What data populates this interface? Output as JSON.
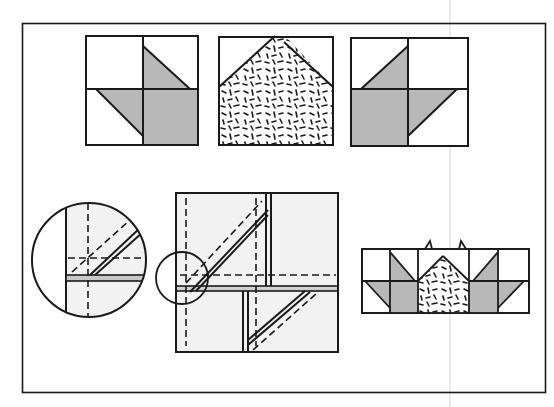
{
  "figure": {
    "colors": {
      "line": "#1a1a1a",
      "shade": "#b8b8b8",
      "light": "#f2f2f2",
      "background": "#ffffff",
      "fold": "#d8d8d8"
    },
    "panels": [
      {
        "id": "block-left",
        "label": ""
      },
      {
        "id": "block-center-print",
        "label": ""
      },
      {
        "id": "block-right",
        "label": ""
      },
      {
        "id": "magnified-detail",
        "label": ""
      },
      {
        "id": "sewing-layout",
        "label": ""
      },
      {
        "id": "assembled-strip",
        "label": ""
      }
    ]
  }
}
